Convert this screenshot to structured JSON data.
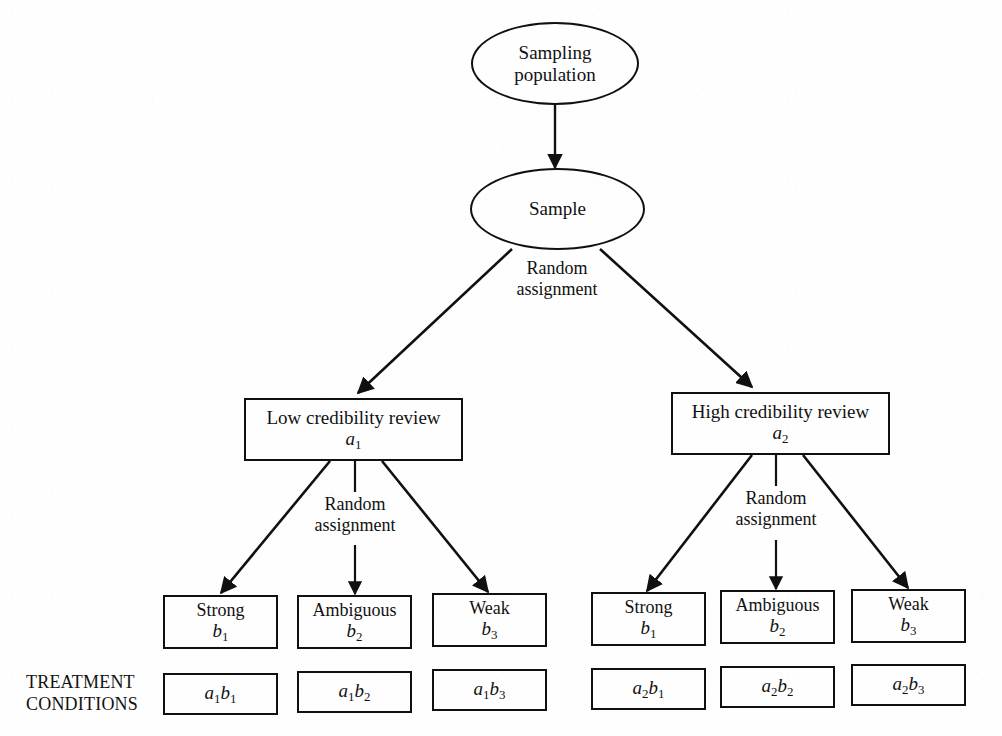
{
  "diagram": {
    "stroke_color": "#101010",
    "background_color": "#fefefe"
  },
  "nodes": {
    "sampling_population": {
      "line1": "Sampling",
      "line2": "population"
    },
    "sample": {
      "line1": "Sample"
    },
    "factor_a": [
      {
        "label": "Low credibility review",
        "code_base": "a",
        "code_sub": "1"
      },
      {
        "label": "High credibility review",
        "code_base": "a",
        "code_sub": "2"
      }
    ],
    "factor_b_left": [
      {
        "label": "Strong",
        "code_base": "b",
        "code_sub": "1"
      },
      {
        "label": "Ambiguous",
        "code_base": "b",
        "code_sub": "2"
      },
      {
        "label": "Weak",
        "code_base": "b",
        "code_sub": "3"
      }
    ],
    "factor_b_right": [
      {
        "label": "Strong",
        "code_base": "b",
        "code_sub": "1"
      },
      {
        "label": "Ambiguous",
        "code_base": "b",
        "code_sub": "2"
      },
      {
        "label": "Weak",
        "code_base": "b",
        "code_sub": "3"
      }
    ],
    "treatment_conditions": [
      {
        "a_base": "a",
        "a_sub": "1",
        "b_base": "b",
        "b_sub": "1"
      },
      {
        "a_base": "a",
        "a_sub": "1",
        "b_base": "b",
        "b_sub": "2"
      },
      {
        "a_base": "a",
        "a_sub": "1",
        "b_base": "b",
        "b_sub": "3"
      },
      {
        "a_base": "a",
        "a_sub": "2",
        "b_base": "b",
        "b_sub": "1"
      },
      {
        "a_base": "a",
        "a_sub": "2",
        "b_base": "b",
        "b_sub": "2"
      },
      {
        "a_base": "a",
        "a_sub": "2",
        "b_base": "b",
        "b_sub": "3"
      }
    ]
  },
  "labels": {
    "random_assignment_top": {
      "line1": "Random",
      "line2": "assignment"
    },
    "random_assignment_left": {
      "line1": "Random",
      "line2": "assignment"
    },
    "random_assignment_right": {
      "line1": "Random",
      "line2": "assignment"
    },
    "treatment_conditions_caption": {
      "line1": "TREATMENT",
      "line2": "CONDITIONS"
    }
  }
}
